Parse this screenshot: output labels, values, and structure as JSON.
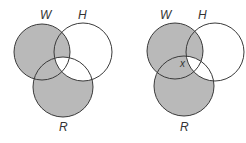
{
  "diagrams": [
    {
      "name": "left-venn",
      "shaded_regions": "W or R, excluding W∩H∩R and H-only (region W∪R minus triple intersection)",
      "labels": {
        "w": "W",
        "h": "H",
        "r": "R"
      },
      "circles": {
        "w": {
          "cx": 42,
          "cy": 52,
          "r": 28
        },
        "h": {
          "cx": 83,
          "cy": 52,
          "r": 29
        },
        "r": {
          "cx": 63,
          "cy": 87,
          "r": 30
        }
      }
    },
    {
      "name": "right-venn",
      "labels": {
        "w": "W",
        "h": "H",
        "r": "R",
        "x": "x"
      },
      "circles": {
        "w": {
          "cx": 175,
          "cy": 51,
          "r": 28
        },
        "h": {
          "cx": 215,
          "cy": 52,
          "r": 29
        },
        "r": {
          "cx": 184,
          "cy": 86,
          "r": 30
        }
      }
    }
  ],
  "colors": {
    "shade": "#b9b9b9",
    "stroke": "#3a3a3a",
    "background": "#ffffff"
  }
}
